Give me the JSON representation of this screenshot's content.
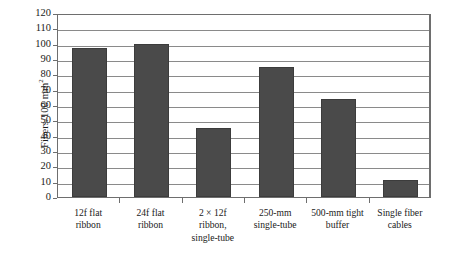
{
  "chart_data": {
    "type": "bar",
    "title": "",
    "xlabel": "",
    "ylabel": "Fibers/100 mm²",
    "ylabel_main": "Fibers/100 mm",
    "ylabel_sup": "2",
    "ylim": [
      0,
      120
    ],
    "ytick_step": 10,
    "grid": true,
    "legend": false,
    "bar_color": "#4a4a4a",
    "frame_color": "#6e6e6e",
    "categories": [
      "12f flat\nribbon",
      "24f flat\nribbon",
      "2 × 12f\nribbon,\nsingle-tube",
      "250-mm\nsingle-tube",
      "500-mm tight\nbuffer",
      "Single fiber\ncables"
    ],
    "values": [
      97,
      100,
      45,
      85,
      64,
      11
    ],
    "yticks": [
      "0",
      "10",
      "20",
      "30",
      "40",
      "50",
      "60",
      "70",
      "80",
      "90",
      "100",
      "110",
      "120"
    ]
  }
}
